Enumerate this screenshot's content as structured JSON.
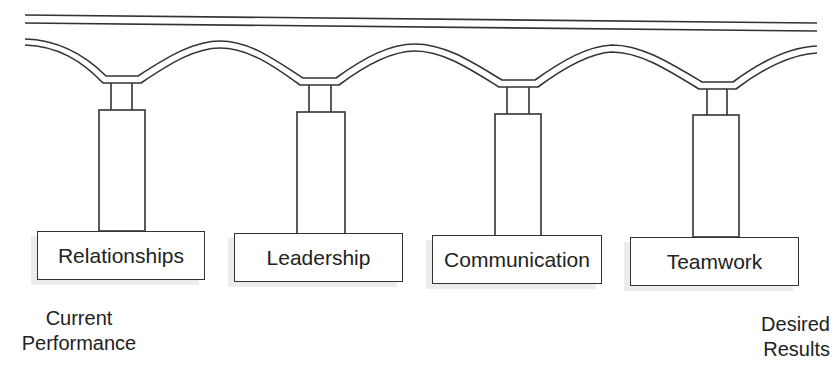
{
  "diagram": {
    "type": "bridge-pillars",
    "pillars": [
      {
        "label": "Relationships"
      },
      {
        "label": "Leadership"
      },
      {
        "label": "Communication"
      },
      {
        "label": "Teamwork"
      }
    ],
    "left_label": {
      "line1": "Current",
      "line2": "Performance"
    },
    "right_label": {
      "line1": "Desired",
      "line2": "Results"
    },
    "line_color": "#333333"
  }
}
